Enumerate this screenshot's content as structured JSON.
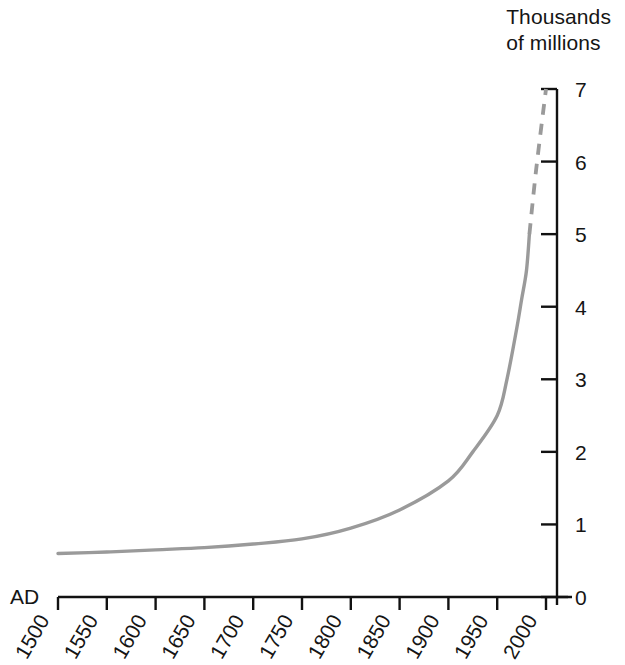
{
  "chart_data": {
    "type": "line",
    "title_line1": "Thousands",
    "title_line2": "of millions",
    "xlabel": "AD",
    "ylabel": "Thousands of millions",
    "xlim": [
      1500,
      2000
    ],
    "ylim": [
      0,
      7
    ],
    "grid": false,
    "legend": "none",
    "xticks": [
      1500,
      1550,
      1600,
      1650,
      1700,
      1750,
      1800,
      1850,
      1900,
      1950,
      2000
    ],
    "xtick_labels": [
      "1500",
      "1550",
      "1600",
      "1650",
      "1700",
      "1750",
      "1800",
      "1850",
      "1900",
      "1950",
      "2000"
    ],
    "xtick_label_rotation": -60,
    "yticks": [
      0,
      1,
      2,
      3,
      4,
      5,
      6,
      7
    ],
    "ytick_labels": [
      "0",
      "1",
      "2",
      "3",
      "4",
      "5",
      "6",
      "7"
    ],
    "series": [
      {
        "name": "World population (observed)",
        "style": "solid",
        "color": "#9a9a9a",
        "x": [
          1500,
          1550,
          1600,
          1650,
          1700,
          1750,
          1800,
          1850,
          1900,
          1925,
          1950,
          1960,
          1970,
          1975,
          1980,
          1983
        ],
        "values": [
          0.6,
          0.62,
          0.65,
          0.68,
          0.73,
          0.8,
          0.95,
          1.2,
          1.6,
          2.0,
          2.5,
          3.0,
          3.7,
          4.1,
          4.5,
          5.0
        ]
      },
      {
        "name": "World population (projected)",
        "style": "dashed",
        "color": "#9a9a9a",
        "x": [
          1983,
          1990,
          2000
        ],
        "values": [
          5.0,
          5.9,
          7.0
        ]
      }
    ],
    "colors": {
      "curve": "#9a9a9a",
      "axis": "#111111",
      "text": "#151515",
      "background": "#ffffff"
    }
  }
}
